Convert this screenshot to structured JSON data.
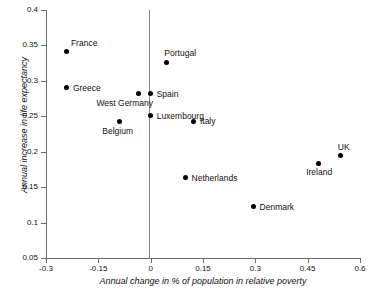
{
  "chart_data": {
    "type": "scatter",
    "title": "",
    "xlabel": "Annual change in % of population in relative poverty",
    "ylabel": "Annual increase in life expectancy",
    "xlim": [
      -0.3,
      0.6
    ],
    "ylim": [
      0.05,
      0.4
    ],
    "xticks": [
      "-0.3",
      "-0.15",
      "0",
      "0.15",
      "0.3",
      "0.45",
      "0.6"
    ],
    "xtick_values": [
      -0.3,
      -0.15,
      0,
      0.15,
      0.3,
      0.45,
      0.6
    ],
    "yticks": [
      "0.05",
      "0.1",
      "0.15",
      "0.2",
      "0.25",
      "0.3",
      "0.35",
      "0.4"
    ],
    "ytick_values": [
      0.05,
      0.1,
      0.15,
      0.2,
      0.25,
      0.3,
      0.35,
      0.4
    ],
    "grid": false,
    "legend": "none",
    "zero_reference_line_x": 0,
    "marker": "filled-circle",
    "marker_color": "#000000",
    "points": [
      {
        "label": "France",
        "x": -0.24,
        "y": 0.341,
        "label_dx": 4,
        "label_dy": -13
      },
      {
        "label": "Greece",
        "x": -0.24,
        "y": 0.29,
        "label_dx": 6,
        "label_dy": -4
      },
      {
        "label": "Belgium",
        "x": -0.09,
        "y": 0.242,
        "label_dx": -17,
        "label_dy": 5
      },
      {
        "label": "West Germany",
        "x": -0.035,
        "y": 0.282,
        "label_dx": -42,
        "label_dy": 5
      },
      {
        "label": "Spain",
        "x": 0.0,
        "y": 0.282,
        "label_dx": 6,
        "label_dy": -4
      },
      {
        "label": "Luxembourg",
        "x": 0.0,
        "y": 0.251,
        "label_dx": 6,
        "label_dy": -4
      },
      {
        "label": "Portugal",
        "x": 0.045,
        "y": 0.326,
        "label_dx": -2,
        "label_dy": -13
      },
      {
        "label": "Italy",
        "x": 0.124,
        "y": 0.243,
        "label_dx": 6,
        "label_dy": -4
      },
      {
        "label": "Netherlands",
        "x": 0.1,
        "y": 0.163,
        "label_dx": 6,
        "label_dy": -4
      },
      {
        "label": "Denmark",
        "x": 0.295,
        "y": 0.122,
        "label_dx": 6,
        "label_dy": -4
      },
      {
        "label": "Ireland",
        "x": 0.48,
        "y": 0.184,
        "label_dx": -12,
        "label_dy": 5
      },
      {
        "label": "UK",
        "x": 0.545,
        "y": 0.194,
        "label_dx": -3,
        "label_dy": -13
      }
    ]
  },
  "axis": {
    "x_title": "Annual change in % of population in relative poverty",
    "y_title": "Annual increase in life expectancy"
  }
}
